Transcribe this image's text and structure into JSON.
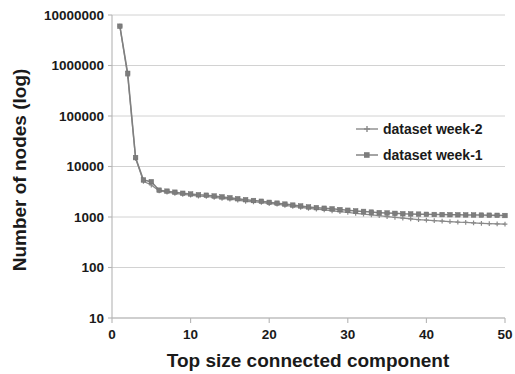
{
  "chart_data": {
    "type": "line",
    "title": "",
    "xlabel": "Top size connected component",
    "ylabel": "Number of nodes (log)",
    "yscale": "log",
    "ylim": [
      10,
      10000000
    ],
    "xlim": [
      0,
      50
    ],
    "grid": true,
    "legend_position": "center-right",
    "x_ticks": [
      "0",
      "10",
      "20",
      "30",
      "40",
      "50"
    ],
    "x_tick_values": [
      0,
      10,
      20,
      30,
      40,
      50
    ],
    "y_ticks": [
      "10000000",
      "1000000",
      "100000",
      "10000",
      "1000",
      "100",
      "10"
    ],
    "y_tick_values": [
      10000000,
      1000000,
      100000,
      10000,
      1000,
      100,
      10
    ],
    "series_color": "#808080",
    "x": [
      1,
      2,
      3,
      4,
      5,
      6,
      7,
      8,
      9,
      10,
      11,
      12,
      13,
      14,
      15,
      16,
      17,
      18,
      19,
      20,
      21,
      22,
      23,
      24,
      25,
      26,
      27,
      28,
      29,
      30,
      31,
      32,
      33,
      34,
      35,
      36,
      37,
      38,
      39,
      40,
      41,
      42,
      43,
      44,
      45,
      46,
      47,
      48,
      49,
      50
    ],
    "series": [
      {
        "name": "dataset week-2",
        "marker": "cross",
        "color": "#8a8a8a",
        "values": [
          6000000,
          620000,
          14500,
          5100,
          4300,
          3300,
          3100,
          2950,
          2800,
          2700,
          2600,
          2550,
          2450,
          2350,
          2250,
          2150,
          2050,
          2000,
          1950,
          1850,
          1800,
          1700,
          1620,
          1560,
          1480,
          1430,
          1380,
          1330,
          1280,
          1230,
          1180,
          1140,
          1100,
          1060,
          1020,
          980,
          950,
          920,
          890,
          870,
          850,
          830,
          810,
          790,
          780,
          765,
          750,
          740,
          730,
          720
        ],
        "final_value": 720
      },
      {
        "name": "dataset week-1",
        "marker": "square",
        "color": "#7d7d7d",
        "values": [
          6000000,
          700000,
          15000,
          5400,
          5000,
          3400,
          3250,
          3100,
          2950,
          2850,
          2750,
          2700,
          2600,
          2500,
          2400,
          2300,
          2200,
          2120,
          2050,
          1950,
          1880,
          1800,
          1720,
          1650,
          1580,
          1530,
          1490,
          1450,
          1400,
          1360,
          1320,
          1290,
          1250,
          1220,
          1200,
          1180,
          1160,
          1150,
          1140,
          1130,
          1120,
          1115,
          1110,
          1105,
          1100,
          1095,
          1090,
          1085,
          1080,
          1070
        ],
        "final_value": 1070
      }
    ]
  },
  "legend": {
    "items": [
      {
        "label": "dataset week-2"
      },
      {
        "label": "dataset week-1"
      }
    ]
  },
  "axes": {
    "x_title": "Top size connected component",
    "y_title": "Number of nodes (log)"
  }
}
